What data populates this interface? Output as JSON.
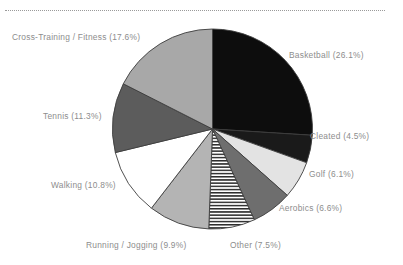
{
  "decor": {
    "top_rule_style": "dotted",
    "top_rule_color": "#9a9a9a"
  },
  "chart_data": {
    "type": "pie",
    "title": "",
    "subtitle": "",
    "xlabel": "",
    "ylabel": "",
    "legend_position": "none",
    "label_format": "{name} ({value}%)",
    "start_angle_deg": 0,
    "direction": "clockwise",
    "categories": [
      "Basketball",
      "Cleated",
      "Golf",
      "Aerobics",
      "Other",
      "Running / Jogging",
      "Walking",
      "Tennis",
      "Cross-Training / Fitness"
    ],
    "values": [
      26.1,
      4.5,
      6.1,
      6.6,
      7.5,
      9.9,
      10.8,
      11.3,
      17.6
    ],
    "slices": [
      {
        "name": "Basketball",
        "value": 26.1,
        "label": "Basketball (26.1%)",
        "fill": "#0d0d0d",
        "pattern": "solid"
      },
      {
        "name": "Cleated",
        "value": 4.5,
        "label": "Cleated (4.5%)",
        "fill": "#1a1a1a",
        "pattern": "solid"
      },
      {
        "name": "Golf",
        "value": 6.1,
        "label": "Golf (6.1%)",
        "fill": "#e3e3e3",
        "pattern": "solid"
      },
      {
        "name": "Aerobics",
        "value": 6.6,
        "label": "Aerobics (6.6%)",
        "fill": "#6e6e6e",
        "pattern": "solid"
      },
      {
        "name": "Other",
        "value": 7.5,
        "label": "Other (7.5%)",
        "fill": "#ffffff",
        "pattern": "horizontal-lines"
      },
      {
        "name": "Running / Jogging",
        "value": 9.9,
        "label": "Running / Jogging (9.9%)",
        "fill": "#b4b4b4",
        "pattern": "solid"
      },
      {
        "name": "Walking",
        "value": 10.8,
        "label": "Walking (10.8%)",
        "fill": "#ffffff",
        "pattern": "solid"
      },
      {
        "name": "Tennis",
        "value": 11.3,
        "label": "Tennis (11.3%)",
        "fill": "#5c5c5c",
        "pattern": "solid"
      },
      {
        "name": "Cross-Training / Fitness",
        "value": 17.6,
        "label": "Cross-Training / Fitness (17.6%)",
        "fill": "#a8a8a8",
        "pattern": "solid"
      }
    ],
    "label_color": "#8d8d8d",
    "outline_color": "#3d3d3d",
    "total": 100.4
  }
}
